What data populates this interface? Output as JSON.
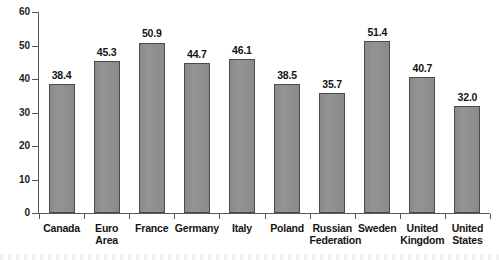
{
  "chart_data": {
    "type": "bar",
    "title": "",
    "subtitle": "",
    "xlabel": "",
    "ylabel": "",
    "ylim": [
      0,
      60
    ],
    "yticks": [
      0,
      10,
      20,
      30,
      40,
      50,
      60
    ],
    "grid": false,
    "legend": false,
    "bar_color": "#8d8d8d",
    "bar_edge_color": "#4a4a4a",
    "axis_color": "#58585a",
    "text_color": "#141414",
    "categories": [
      "Canada",
      "Euro Area",
      "France",
      "Germany",
      "Italy",
      "Poland",
      "Russian Federation",
      "Sweden",
      "United Kingdom",
      "United States"
    ],
    "category_lines": [
      [
        "Canada"
      ],
      [
        "Euro Area"
      ],
      [
        "France"
      ],
      [
        "Germany"
      ],
      [
        "Italy"
      ],
      [
        "Poland"
      ],
      [
        "Russian",
        "Federation"
      ],
      [
        "Sweden"
      ],
      [
        "United",
        "Kingdom"
      ],
      [
        "United",
        "States"
      ]
    ],
    "values": [
      38.4,
      45.3,
      50.9,
      44.7,
      46.1,
      38.5,
      35.7,
      51.4,
      40.7,
      32.0
    ],
    "value_labels": [
      "38.4",
      "45.3",
      "50.9",
      "44.7",
      "46.1",
      "38.5",
      "35.7",
      "51.4",
      "40.7",
      "32.0"
    ],
    "ytick_labels": [
      "0",
      "10",
      "20",
      "30",
      "40",
      "50",
      "60"
    ]
  }
}
